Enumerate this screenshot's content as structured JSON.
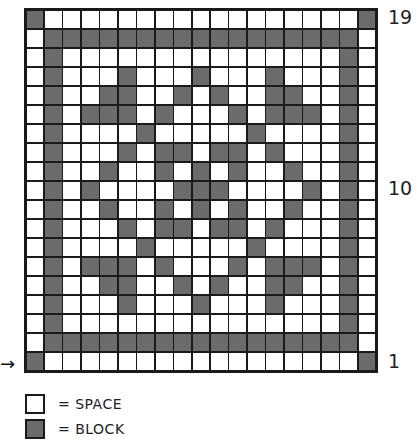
{
  "chart": {
    "rows": 19,
    "cols": 19,
    "start_arrow": "→",
    "row_labels": [
      {
        "text": "19",
        "row_from_bottom": 19
      },
      {
        "text": "10",
        "row_from_bottom": 10
      },
      {
        "text": "1",
        "row_from_bottom": 1
      }
    ],
    "pattern_top_to_bottom": [
      "X.................X",
      ".XXXXXXXXXXXXXXXXX.",
      ".X...............X.",
      ".X...X...X...X...X.",
      ".X..XX..X.X..XX..X.",
      ".X.XXX.X...X.XXX.X.",
      ".X....X.....X....X.",
      ".X...X.XX.XX.X...X.",
      ".X..X..X.X.X..X..X.",
      ".X.X....XXX....X.X.",
      ".X..X..X.X.X..X..X.",
      ".X...X.XX.XX.X...X.",
      ".X....X.....X....X.",
      ".X.XXX.X...X.XXX.X.",
      ".X..XX..X.X..XX..X.",
      ".X...X...X...X...X.",
      ".X...............X.",
      ".XXXXXXXXXXXXXXXXX.",
      "X.................X"
    ],
    "colors": {
      "block": "#6b6b6b",
      "space": "#ffffff",
      "line": "#1a1a1a"
    }
  },
  "legend": {
    "items": [
      {
        "swatch": "space",
        "label": "= SPACE"
      },
      {
        "swatch": "block",
        "label": "= BLOCK"
      }
    ]
  }
}
